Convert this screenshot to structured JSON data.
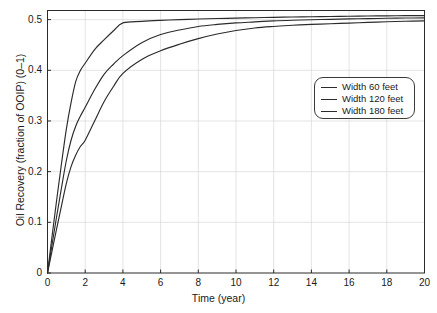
{
  "chart_data": {
    "type": "line",
    "title": "",
    "xlabel": "Time (year)",
    "ylabel": "Oil Recovery (fraction of OOIP) (0–1)",
    "xlim": [
      0,
      20
    ],
    "ylim": [
      0,
      0.518
    ],
    "grid": true,
    "legend_position": "upper right",
    "xticks": [
      0,
      2,
      4,
      6,
      8,
      10,
      12,
      14,
      16,
      18,
      20
    ],
    "xtick_labels": [
      "0",
      "2",
      "4",
      "6",
      "8",
      "10",
      "12",
      "14",
      "16",
      "18",
      "20"
    ],
    "yticks": [
      0,
      0.1,
      0.2,
      0.3,
      0.4,
      0.5
    ],
    "ytick_labels": [
      "0",
      "0.1",
      "0.2",
      "0.3",
      "0.4",
      "0.5"
    ],
    "x": [
      0,
      0.25,
      0.5,
      0.75,
      1,
      1.25,
      1.5,
      1.75,
      2,
      2.5,
      3,
      3.5,
      4,
      5,
      6,
      7,
      8,
      9,
      10,
      11,
      12,
      13,
      14,
      15,
      16,
      17,
      18,
      19,
      20
    ],
    "series": [
      {
        "name": "Width 60 feet",
        "color": "#2b2b2b",
        "values": [
          0.0,
          0.075,
          0.148,
          0.218,
          0.284,
          0.336,
          0.378,
          0.4,
          0.414,
          0.441,
          0.46,
          0.478,
          0.4935,
          0.4965,
          0.4985,
          0.5,
          0.5012,
          0.5022,
          0.503,
          0.5038,
          0.5045,
          0.5051,
          0.5057,
          0.5062,
          0.5067,
          0.5071,
          0.5075,
          0.5078,
          0.508
        ]
      },
      {
        "name": "Width 120 feet",
        "color": "#2b2b2b",
        "values": [
          0.0,
          0.058,
          0.115,
          0.17,
          0.222,
          0.262,
          0.29,
          0.31,
          0.327,
          0.362,
          0.392,
          0.412,
          0.429,
          0.4545,
          0.4705,
          0.4795,
          0.4865,
          0.4905,
          0.4935,
          0.4955,
          0.4975,
          0.4988,
          0.4998,
          0.5006,
          0.5014,
          0.502,
          0.5026,
          0.5031,
          0.5035
        ]
      },
      {
        "name": "Width 180 feet",
        "color": "#2b2b2b",
        "values": [
          0.0,
          0.045,
          0.09,
          0.134,
          0.177,
          0.21,
          0.233,
          0.25,
          0.262,
          0.3,
          0.338,
          0.368,
          0.394,
          0.4215,
          0.4385,
          0.4515,
          0.4625,
          0.4715,
          0.4785,
          0.4835,
          0.4865,
          0.4888,
          0.4905,
          0.4918,
          0.4932,
          0.4945,
          0.4958,
          0.4968,
          0.4975
        ]
      }
    ]
  },
  "legend": {
    "items": [
      {
        "label": "Width 60 feet"
      },
      {
        "label": "Width 120 feet"
      },
      {
        "label": "Width 180 feet"
      }
    ]
  },
  "axes": {
    "x_title": "Time (year)",
    "y_title": "Oil Recovery (fraction of OOIP) (0–1)"
  }
}
